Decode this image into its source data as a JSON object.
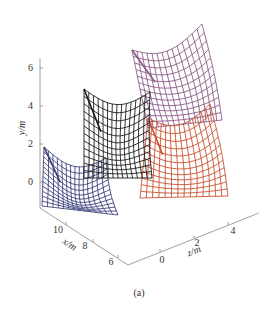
{
  "figure": {
    "caption": "(a)"
  },
  "chart_data": {
    "type": "surface-3d-wireframe",
    "title": "",
    "caption": "(a)",
    "axes": {
      "y": {
        "label": "y/m",
        "ticks": [
          "0",
          "2",
          "4",
          "6"
        ],
        "range": [
          -1,
          6.5
        ]
      },
      "x": {
        "label": "x/m",
        "ticks": [
          "10",
          "8",
          "6"
        ],
        "range": [
          5,
          11
        ]
      },
      "z": {
        "label": "z/m",
        "ticks": [
          "0",
          "2",
          "4"
        ],
        "range": [
          -1,
          5
        ]
      }
    },
    "grid": false,
    "legend": null,
    "series": [
      {
        "name": "surface-1",
        "color": "#3a3f7a",
        "description": "blue/navy mesh, front-left, lowest"
      },
      {
        "name": "surface-2",
        "color": "#1a1a1a",
        "description": "black mesh, middle"
      },
      {
        "name": "surface-3",
        "color": "#8a5a86",
        "description": "purple/mauve mesh, back-upper-right, highest"
      },
      {
        "name": "surface-4",
        "color": "#c8502e",
        "description": "red/orange mesh, right-lower"
      }
    ]
  }
}
